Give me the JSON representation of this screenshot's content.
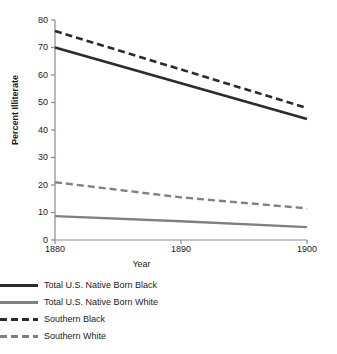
{
  "chart_data": {
    "type": "line",
    "title": "",
    "xlabel": "Year",
    "ylabel": "Percent Illiterate",
    "x": [
      1880,
      1890,
      1900
    ],
    "xlim": [
      1880,
      1900
    ],
    "ylim": [
      0,
      80
    ],
    "xticks": [
      1880,
      1890,
      1900
    ],
    "yticks": [
      0,
      10,
      20,
      30,
      40,
      50,
      60,
      70,
      80
    ],
    "grid": false,
    "legend_position": "below",
    "series": [
      {
        "name": "Total U.S. Native Born Black",
        "values": [
          70,
          57,
          44
        ],
        "color": "#2b2b2b",
        "style": "solid",
        "width": 2.6
      },
      {
        "name": "Total U.S. Native Born White",
        "values": [
          8.7,
          6.8,
          4.7
        ],
        "color": "#808080",
        "style": "solid",
        "width": 2.4
      },
      {
        "name": "Southern Black",
        "values": [
          76,
          62,
          48
        ],
        "color": "#2b2b2b",
        "style": "dashed",
        "width": 2.6
      },
      {
        "name": "Southern White",
        "values": [
          21,
          15.5,
          11.5
        ],
        "color": "#808080",
        "style": "dashed",
        "width": 2.4
      }
    ]
  },
  "axes": {
    "y_title": "Percent Illiterate",
    "x_title": "Year",
    "y_tick_labels": [
      "80",
      "70",
      "60",
      "50",
      "40",
      "30",
      "20",
      "10",
      "0"
    ],
    "x_tick_labels": [
      "1880",
      "1890",
      "1900"
    ],
    "axis_color": "#8a8a8a"
  },
  "legend": {
    "items": [
      {
        "label": "Total U.S. Native Born Black",
        "sample": "solid-dark-line-icon"
      },
      {
        "label": "Total U.S. Native Born White",
        "sample": "solid-gray-line-icon"
      },
      {
        "label": "Southern Black",
        "sample": "dashed-dark-line-icon"
      },
      {
        "label": "Southern White",
        "sample": "dashed-gray-line-icon"
      }
    ]
  },
  "caption": {
    "text": ""
  }
}
